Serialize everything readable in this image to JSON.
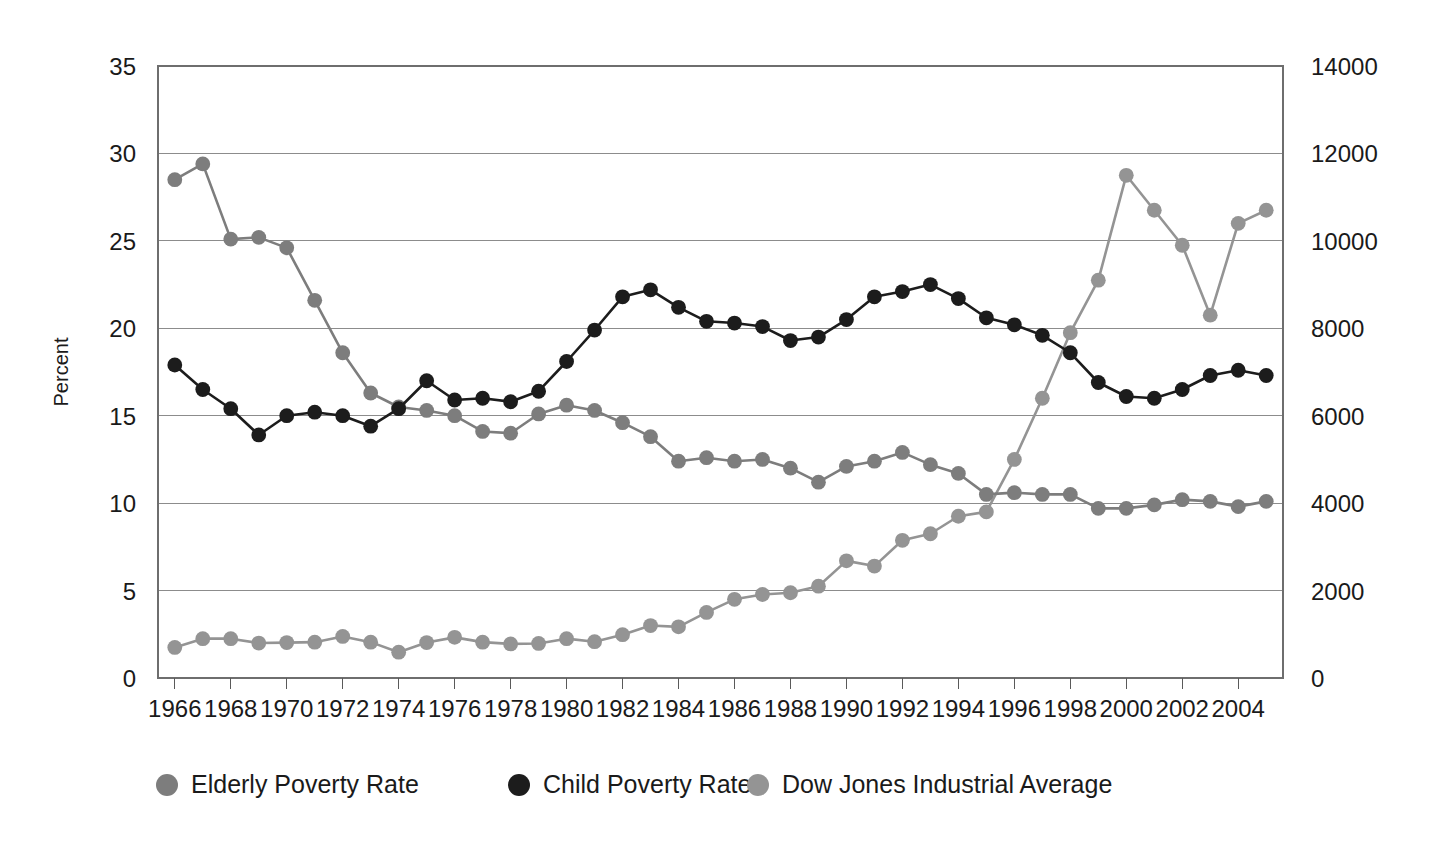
{
  "chart_data": {
    "type": "line",
    "title": "",
    "subtitle": "",
    "xlabel": "",
    "ylabel": "Percent",
    "y2label": "",
    "grid": true,
    "legend_position": "bottom",
    "xlim": [
      1965.4,
      2005.6
    ],
    "ylim": [
      0,
      35
    ],
    "y2lim": [
      0,
      14000
    ],
    "x_tick_labels": [
      "1966",
      "1968",
      "1970",
      "1972",
      "1974",
      "1976",
      "1978",
      "1980",
      "1982",
      "1984",
      "1986",
      "1988",
      "1990",
      "1992",
      "1994",
      "1996",
      "1998",
      "2000",
      "2002",
      "2004"
    ],
    "x_tick_values": [
      1966,
      1968,
      1970,
      1972,
      1974,
      1976,
      1978,
      1980,
      1982,
      1984,
      1986,
      1988,
      1990,
      1992,
      1994,
      1996,
      1998,
      2000,
      2002,
      2004
    ],
    "y_tick_labels": [
      "0",
      "5",
      "10",
      "15",
      "20",
      "25",
      "30",
      "35"
    ],
    "y_tick_values": [
      0,
      5,
      10,
      15,
      20,
      25,
      30,
      35
    ],
    "y2_tick_labels": [
      "0",
      "2000",
      "4000",
      "6000",
      "8000",
      "10000",
      "12000",
      "14000"
    ],
    "y2_tick_values": [
      0,
      2000,
      4000,
      6000,
      8000,
      10000,
      12000,
      14000
    ],
    "x": [
      1966,
      1967,
      1968,
      1969,
      1970,
      1971,
      1972,
      1973,
      1974,
      1975,
      1976,
      1977,
      1978,
      1979,
      1980,
      1981,
      1982,
      1983,
      1984,
      1985,
      1986,
      1987,
      1988,
      1989,
      1990,
      1991,
      1992,
      1993,
      1994,
      1995,
      1996,
      1997,
      1998,
      1999,
      2000,
      2001,
      2002,
      2003,
      2004,
      2005
    ],
    "series": [
      {
        "name": "Elderly Poverty Rate",
        "axis": "left",
        "color": "#7d7d7d",
        "marker": "circle",
        "values": [
          28.5,
          29.4,
          25.1,
          25.2,
          24.6,
          21.6,
          18.6,
          16.3,
          15.5,
          15.3,
          15.0,
          14.1,
          14.0,
          15.1,
          15.6,
          15.3,
          14.6,
          13.8,
          12.4,
          12.6,
          12.4,
          12.5,
          12.0,
          11.2,
          12.1,
          12.4,
          12.9,
          12.2,
          11.7,
          10.5,
          10.6,
          10.5,
          10.5,
          9.7,
          9.7,
          9.9,
          10.2,
          10.1,
          9.8,
          10.1
        ]
      },
      {
        "name": "Child Poverty Rate",
        "axis": "left",
        "color": "#1c1c1c",
        "marker": "circle",
        "values": [
          17.9,
          16.5,
          15.4,
          13.9,
          15.0,
          15.2,
          15.0,
          14.4,
          15.4,
          17.0,
          15.9,
          16.0,
          15.8,
          16.4,
          18.1,
          19.9,
          21.8,
          22.2,
          21.2,
          20.4,
          20.3,
          20.1,
          19.3,
          19.5,
          20.5,
          21.8,
          22.1,
          22.5,
          21.7,
          20.6,
          20.2,
          19.6,
          18.6,
          16.9,
          16.1,
          16.0,
          16.5,
          17.3,
          17.6,
          17.3
        ]
      },
      {
        "name": "Dow Jones Industrial Average",
        "axis": "right",
        "color": "#949494",
        "marker": "circle",
        "values": [
          700,
          900,
          900,
          800,
          810,
          820,
          950,
          820,
          590,
          810,
          930,
          820,
          780,
          790,
          900,
          830,
          990,
          1200,
          1170,
          1500,
          1800,
          1910,
          1950,
          2100,
          2680,
          2560,
          3150,
          3300,
          3700,
          3800,
          5000,
          6400,
          7900,
          9100,
          11500,
          10700,
          9900,
          8300,
          10400,
          10700
        ]
      }
    ]
  },
  "legend": {
    "items": [
      {
        "label": "Elderly Poverty Rate",
        "color": "#7d7d7d"
      },
      {
        "label": "Child Poverty Rate",
        "color": "#1c1c1c"
      },
      {
        "label": "Dow Jones Industrial Average",
        "color": "#949494"
      }
    ]
  }
}
